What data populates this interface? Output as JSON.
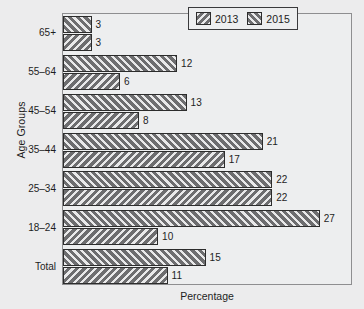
{
  "chart_data": {
    "type": "bar",
    "orientation": "horizontal",
    "title": "",
    "xlabel": "Percentage",
    "ylabel": "Age Groups",
    "categories": [
      "Total",
      "18–24",
      "25–34",
      "35–44",
      "45–54",
      "55–64",
      "65+"
    ],
    "categories_top_to_bottom": [
      "65+",
      "55–64",
      "45–54",
      "35–44",
      "25–34",
      "18–24",
      "Total"
    ],
    "series": [
      {
        "name": "2013",
        "hatch": "backslash",
        "values_top_to_bottom": [
          3,
          6,
          8,
          17,
          22,
          10,
          11
        ]
      },
      {
        "name": "2015",
        "hatch": "forwardslash",
        "values_top_to_bottom": [
          3,
          12,
          13,
          21,
          22,
          27,
          15
        ]
      }
    ],
    "xlim": [
      0,
      30.5
    ],
    "grid": false,
    "xticks_visible": false,
    "yticks_visible": true,
    "legend_position": "top-right",
    "bar_face_color": "#6e6e70",
    "bar_edge_color": "#2c2c2c",
    "plot_background": "#edeeef",
    "figure_background": "#ececed",
    "text_color": "#1d1d1d"
  },
  "axes": {
    "y_title": "Age Groups",
    "x_title": "Percentage"
  },
  "legend": {
    "items": [
      {
        "label": "2013",
        "hatch": "backslash"
      },
      {
        "label": "2015",
        "hatch": "forwardslash"
      }
    ]
  },
  "groups": [
    {
      "category": "65+",
      "v2015": 3,
      "v2013": 3,
      "label2015": "3",
      "label2013": "3"
    },
    {
      "category": "55–64",
      "v2015": 12,
      "v2013": 6,
      "label2015": "12",
      "label2013": "6"
    },
    {
      "category": "45–54",
      "v2015": 13,
      "v2013": 8,
      "label2015": "13",
      "label2013": "8"
    },
    {
      "category": "35–44",
      "v2015": 21,
      "v2013": 17,
      "label2015": "21",
      "label2013": "17"
    },
    {
      "category": "25–34",
      "v2015": 22,
      "v2013": 22,
      "label2015": "22",
      "label2013": "22"
    },
    {
      "category": "18–24",
      "v2015": 27,
      "v2013": 10,
      "label2015": "27",
      "label2013": "10"
    },
    {
      "category": "Total",
      "v2015": 15,
      "v2013": 11,
      "label2015": "15",
      "label2013": "11"
    }
  ]
}
